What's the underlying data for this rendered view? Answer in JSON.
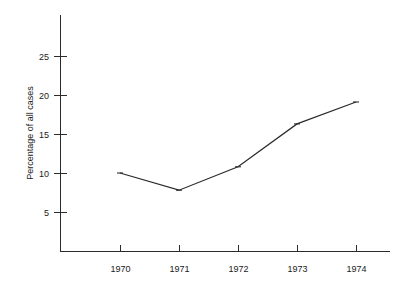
{
  "chart_data": {
    "type": "line",
    "title": "",
    "subtitle": "",
    "xlabel": "",
    "ylabel": "Percentage of all cases",
    "categories": [
      "1970",
      "1971",
      "1972",
      "1973",
      "1974"
    ],
    "x": [
      1970,
      1971,
      1972,
      1973,
      1974
    ],
    "values": [
      10.0,
      7.8,
      10.8,
      16.3,
      19.1
    ],
    "series": [
      {
        "name": "Percentage of all cases",
        "values": [
          10.0,
          7.8,
          10.8,
          16.3,
          19.1
        ],
        "color": "#2b2b2b",
        "marker": "tick"
      }
    ],
    "xlim": [
      1969.0,
      1974.6
    ],
    "ylim": [
      0,
      30
    ],
    "ytick_labels": [
      "25",
      "20",
      "15",
      "10",
      "5"
    ],
    "ytick_values": [
      25,
      20,
      15,
      10,
      5
    ],
    "xtick_labels": [
      "1970",
      "1971",
      "1972",
      "1973",
      "1974"
    ],
    "grid": false,
    "legend": false,
    "legend_position": "none",
    "annotations": [],
    "colors": {
      "line": "#2b2b2b",
      "axis": "#2b2b2b",
      "text": "#1a1a1a",
      "background": "#ffffff"
    }
  },
  "axes": {
    "y_title": "Percentage of all cases",
    "y_ticks": [
      {
        "label": "25",
        "value": 25
      },
      {
        "label": "20",
        "value": 20
      },
      {
        "label": "15",
        "value": 15
      },
      {
        "label": "10",
        "value": 10
      },
      {
        "label": "5",
        "value": 5
      }
    ],
    "x_ticks": [
      {
        "label": "1970",
        "value": 1970
      },
      {
        "label": "1971",
        "value": 1971
      },
      {
        "label": "1972",
        "value": 1972
      },
      {
        "label": "1973",
        "value": 1973
      },
      {
        "label": "1974",
        "value": 1974
      }
    ]
  }
}
